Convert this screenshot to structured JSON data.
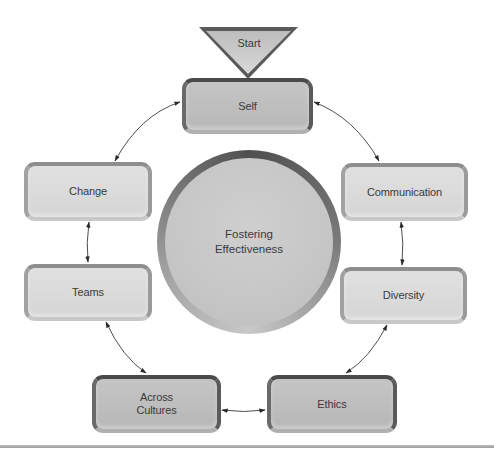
{
  "diagram": {
    "type": "cycle",
    "start": {
      "label": "Start"
    },
    "center": {
      "line1": "Fostering",
      "line2": "Effectiveness"
    },
    "nodes": [
      {
        "id": "self",
        "label": "Self",
        "style": "dark"
      },
      {
        "id": "communication",
        "label": "Communication",
        "style": "light"
      },
      {
        "id": "diversity",
        "label": "Diversity",
        "style": "light"
      },
      {
        "id": "ethics",
        "label": "Ethics",
        "style": "dark"
      },
      {
        "id": "across-cultures",
        "line1": "Across",
        "line2": "Cultures",
        "style": "dark"
      },
      {
        "id": "teams",
        "label": "Teams",
        "style": "light"
      },
      {
        "id": "change",
        "label": "Change",
        "style": "light"
      }
    ],
    "edges": [
      {
        "from": "start",
        "to": "self",
        "type": "flow"
      },
      {
        "from": "self",
        "to": "communication",
        "type": "bidirectional"
      },
      {
        "from": "communication",
        "to": "diversity",
        "type": "bidirectional"
      },
      {
        "from": "diversity",
        "to": "ethics",
        "type": "bidirectional"
      },
      {
        "from": "ethics",
        "to": "across-cultures",
        "type": "bidirectional"
      },
      {
        "from": "across-cultures",
        "to": "teams",
        "type": "bidirectional"
      },
      {
        "from": "teams",
        "to": "change",
        "type": "bidirectional"
      },
      {
        "from": "change",
        "to": "self",
        "type": "bidirectional"
      }
    ]
  }
}
